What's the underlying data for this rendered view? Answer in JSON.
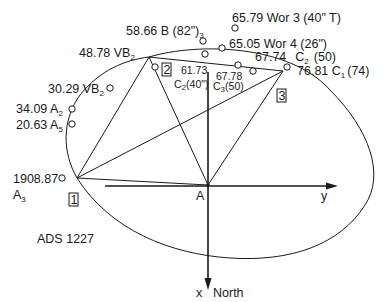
{
  "diagram": {
    "title": "ADS 1227",
    "origin_label": "A",
    "axis_y_label": "y",
    "axis_x_label": "x",
    "axis_x_direction": "North",
    "station_points": [
      {
        "id": "1",
        "label": "1"
      },
      {
        "id": "2",
        "label": "2"
      },
      {
        "id": "3",
        "label": "3"
      }
    ],
    "observations": [
      {
        "epoch": "1908.87",
        "observer": "A",
        "sub": "3"
      },
      {
        "epoch": "20.63",
        "observer": "A",
        "sub": "5"
      },
      {
        "epoch": "34.09",
        "observer": "A",
        "sub": "2"
      },
      {
        "epoch": "30.29",
        "observer": "VB",
        "sub": "2"
      },
      {
        "epoch": "48.78",
        "observer": "VB",
        "sub": "2"
      },
      {
        "epoch": "58.66",
        "observer": "B (82\")",
        "sub": "3"
      },
      {
        "epoch": "61.73",
        "observer": "C",
        "sub": "2",
        "suffix": "(40\")"
      },
      {
        "epoch": "67.78",
        "observer": "C",
        "sub": "3",
        "suffix": "(50)"
      },
      {
        "epoch": "65.05",
        "observer": "Wor 4 (26\")",
        "sub": ""
      },
      {
        "epoch": "65.79",
        "observer": "Wor 3 (40\" T)",
        "sub": ""
      },
      {
        "epoch": "67.74",
        "observer": "C",
        "sub": "2",
        "suffix": "(50)"
      },
      {
        "epoch": "76.81",
        "observer": "C",
        "sub": "1",
        "suffix": "(74)"
      }
    ],
    "labels": {
      "obs_1908": "1908.87",
      "obs_1908_name": "A",
      "obs_1908_sub": "3",
      "obs_2063": "20.63 A",
      "obs_2063_sub": "5",
      "obs_3409": "34.09 A",
      "obs_3409_sub": "2",
      "obs_3029": "30.29 VB",
      "obs_3029_sub": "2",
      "obs_4878": "48.78 VB",
      "obs_4878_sub": "2",
      "obs_5866": "58.66 B (82\")",
      "obs_5866_sub": "3",
      "obs_6173": "61.73",
      "obs_6173_name": "C",
      "obs_6173_sub": "2",
      "obs_6173_suffix": "(40\")",
      "obs_6778": "67.78",
      "obs_6778_name": "C",
      "obs_6778_sub": "3",
      "obs_6778_suffix": "(50)",
      "obs_6505": "65.05 Wor 4 (26\")",
      "obs_6579": "65.79 Wor 3 (40\" T)",
      "obs_6774": "67.74",
      "obs_6774_name": "C",
      "obs_6774_sub": "2",
      "obs_6774_suffix": "(50)",
      "obs_7681": "76.81 C",
      "obs_7681_sub": "1",
      "obs_7681_suffix": "(74)"
    }
  }
}
